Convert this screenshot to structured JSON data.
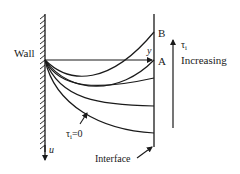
{
  "diagram": {
    "labels": {
      "wall": "Wall",
      "y_axis": "y",
      "u_axis": "u",
      "point_a": "A",
      "point_b": "B",
      "tau_symbol": "τ",
      "tau_sub": "i",
      "increasing": "Increasing",
      "tau_zero_symbol": "τ",
      "tau_zero_sub": "i",
      "tau_zero_value": "=0",
      "interface": "Interface"
    },
    "colors": {
      "ink": "#1a1a1a",
      "background": "#ffffff"
    },
    "curves": [
      {
        "name": "profile-b",
        "end_label": "B"
      },
      {
        "name": "profile-a",
        "end_label": "A"
      },
      {
        "name": "profile-3",
        "end_label": ""
      },
      {
        "name": "profile-4",
        "end_label": ""
      },
      {
        "name": "profile-tau-zero",
        "end_label": "τi=0"
      }
    ]
  }
}
